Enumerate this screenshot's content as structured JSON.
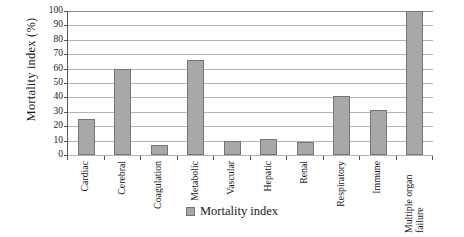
{
  "chart_data": {
    "type": "bar",
    "title": "",
    "xlabel": "",
    "ylabel": "Mortality index (%)",
    "ylim": [
      0,
      100
    ],
    "ytick_step": 10,
    "yticks": [
      100,
      90,
      80,
      70,
      60,
      50,
      40,
      30,
      20,
      10,
      0
    ],
    "grid": "horizontal",
    "legend_position": "bottom-center",
    "categories": [
      "Cardiac",
      "Cerebral",
      "Coagulation",
      "Metabolic",
      "Vascular",
      "Hepatic",
      "Renal",
      "Respiratory",
      "Immune",
      "Multiple organ failure"
    ],
    "series": [
      {
        "name": "Mortality index",
        "color": "#a8a8a8",
        "values": [
          25,
          60,
          7,
          66,
          10,
          11,
          9,
          41,
          31,
          100
        ]
      }
    ]
  },
  "legend": {
    "entries": [
      {
        "label": "Mortality index",
        "swatch": "legend-swatch-mortality-index"
      }
    ]
  },
  "colors": {
    "bar_fill": "#a8a8a8",
    "bar_border": "#757575",
    "gridline": "#b4b4b4",
    "axis": "#555555",
    "background": "#ffffff"
  }
}
